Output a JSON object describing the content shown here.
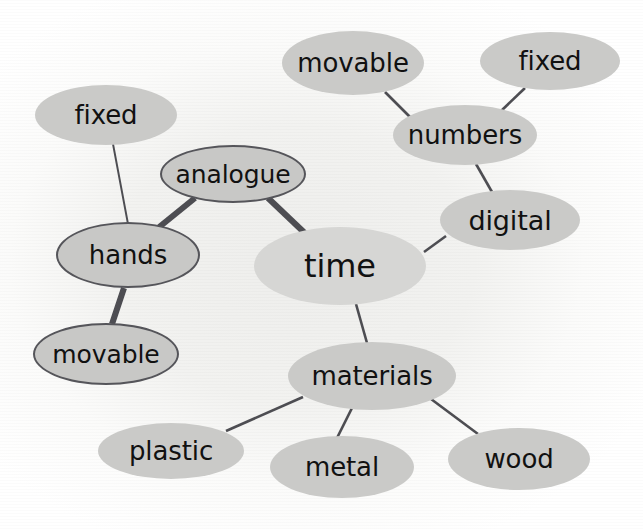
{
  "diagram": {
    "type": "mind-map",
    "background_color": "#f3f3f1",
    "node_fill_color": "#cacac8",
    "center_node_fill_color": "#d6d6d4",
    "node_outline_color": "#55555a",
    "edge_color": "#4d4d52",
    "text_color": "#111111",
    "nodes": [
      {
        "id": "time",
        "label": "time",
        "role": "center",
        "outlined": false,
        "cx": 340,
        "cy": 266,
        "rx": 86,
        "ry": 39,
        "font_size": 32
      },
      {
        "id": "analogue",
        "label": "analogue",
        "role": "branch",
        "outlined": true,
        "cx": 233,
        "cy": 174,
        "rx": 73,
        "ry": 29,
        "font_size": 25
      },
      {
        "id": "hands",
        "label": "hands",
        "role": "branch",
        "outlined": true,
        "cx": 128,
        "cy": 255,
        "rx": 72,
        "ry": 33,
        "font_size": 26
      },
      {
        "id": "fixed-left",
        "label": "fixed",
        "role": "leaf",
        "outlined": false,
        "cx": 106,
        "cy": 115,
        "rx": 71,
        "ry": 30,
        "font_size": 26
      },
      {
        "id": "movable-left",
        "label": "movable",
        "role": "leaf",
        "outlined": true,
        "cx": 106,
        "cy": 354,
        "rx": 73,
        "ry": 31,
        "font_size": 25
      },
      {
        "id": "digital",
        "label": "digital",
        "role": "branch",
        "outlined": false,
        "cx": 510,
        "cy": 220,
        "rx": 70,
        "ry": 30,
        "font_size": 27
      },
      {
        "id": "numbers",
        "label": "numbers",
        "role": "branch",
        "outlined": false,
        "cx": 465,
        "cy": 135,
        "rx": 72,
        "ry": 30,
        "font_size": 26
      },
      {
        "id": "movable-top",
        "label": "movable",
        "role": "leaf",
        "outlined": false,
        "cx": 353,
        "cy": 63,
        "rx": 71,
        "ry": 32,
        "font_size": 26
      },
      {
        "id": "fixed-right",
        "label": "fixed",
        "role": "leaf",
        "outlined": false,
        "cx": 550,
        "cy": 61,
        "rx": 70,
        "ry": 29,
        "font_size": 26
      },
      {
        "id": "materials",
        "label": "materials",
        "role": "branch",
        "outlined": false,
        "cx": 372,
        "cy": 376,
        "rx": 84,
        "ry": 34,
        "font_size": 26
      },
      {
        "id": "plastic",
        "label": "plastic",
        "role": "leaf",
        "outlined": false,
        "cx": 171,
        "cy": 451,
        "rx": 73,
        "ry": 28,
        "font_size": 26
      },
      {
        "id": "metal",
        "label": "metal",
        "role": "leaf",
        "outlined": false,
        "cx": 342,
        "cy": 467,
        "rx": 72,
        "ry": 31,
        "font_size": 26
      },
      {
        "id": "wood",
        "label": "wood",
        "role": "leaf",
        "outlined": false,
        "cx": 519,
        "cy": 459,
        "rx": 71,
        "ry": 31,
        "font_size": 26
      }
    ],
    "edges": [
      {
        "from": "analogue",
        "to": "time",
        "x1": 268,
        "y1": 198,
        "x2": 310,
        "y2": 238,
        "width": 6
      },
      {
        "from": "analogue",
        "to": "hands",
        "x1": 195,
        "y1": 198,
        "x2": 158,
        "y2": 228,
        "width": 6
      },
      {
        "from": "hands",
        "to": "movable-left",
        "x1": 124,
        "y1": 288,
        "x2": 112,
        "y2": 324,
        "width": 6
      },
      {
        "from": "fixed-left",
        "to": "hands",
        "x1": 113,
        "y1": 144,
        "x2": 128,
        "y2": 224,
        "width": 2
      },
      {
        "from": "time",
        "to": "digital",
        "x1": 424,
        "y1": 252,
        "x2": 446,
        "y2": 236,
        "width": 2.6
      },
      {
        "from": "digital",
        "to": "numbers",
        "x1": 492,
        "y1": 192,
        "x2": 476,
        "y2": 164,
        "width": 2.6
      },
      {
        "from": "numbers",
        "to": "movable-top",
        "x1": 410,
        "y1": 117,
        "x2": 385,
        "y2": 92,
        "width": 2.6
      },
      {
        "from": "numbers",
        "to": "fixed-right",
        "x1": 500,
        "y1": 112,
        "x2": 525,
        "y2": 88,
        "width": 2.6
      },
      {
        "from": "time",
        "to": "materials",
        "x1": 356,
        "y1": 304,
        "x2": 367,
        "y2": 343,
        "width": 2.6
      },
      {
        "from": "materials",
        "to": "plastic",
        "x1": 303,
        "y1": 397,
        "x2": 226,
        "y2": 431,
        "width": 2.6
      },
      {
        "from": "materials",
        "to": "metal",
        "x1": 353,
        "y1": 406,
        "x2": 337,
        "y2": 438,
        "width": 2.6
      },
      {
        "from": "materials",
        "to": "wood",
        "x1": 431,
        "y1": 399,
        "x2": 478,
        "y2": 434,
        "width": 2.6
      }
    ]
  }
}
